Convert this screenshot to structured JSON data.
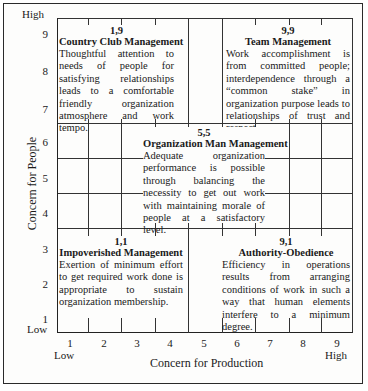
{
  "diagram": {
    "type": "managerial-grid",
    "y_axis": {
      "title": "Concern for People",
      "ticks": [
        "1",
        "2",
        "3",
        "4",
        "5",
        "6",
        "7",
        "8",
        "9"
      ],
      "low_label": "Low",
      "high_label": "High"
    },
    "x_axis": {
      "title": "Concern for Production",
      "ticks": [
        "1",
        "2",
        "3",
        "4",
        "5",
        "6",
        "7",
        "8",
        "9"
      ],
      "low_label": "Low",
      "high_label": "High"
    },
    "styles": [
      {
        "id": "country-club",
        "coord": "1,9",
        "title": "Country Club Management",
        "description": "Thoughtful attention to needs of people for satisfying relationships leads to a comfortable friendly organization atmosphere and work tempo."
      },
      {
        "id": "team",
        "coord": "9,9",
        "title": "Team Management",
        "description": "Work accomplishment is from committed people; interdependence through a “common stake” in organization purpose leads to relationships of trust and respect."
      },
      {
        "id": "organization-man",
        "coord": "5,5",
        "title": "Organization Man Management",
        "description": "Adequate organization performance is possible through balancing the necessity to get out work with maintaining morale of people at a satisfactory level."
      },
      {
        "id": "impoverished",
        "coord": "1,1",
        "title": "Impoverished Management",
        "description": "Exertion of minimum effort to get required work done is appropriate to sustain organization membership."
      },
      {
        "id": "authority-obedience",
        "coord": "9,1",
        "title": "Authority-Obedience",
        "description": "Efficiency in operations results from arranging conditions of work in such a way that human elements interfere to a minimum degree."
      }
    ]
  }
}
